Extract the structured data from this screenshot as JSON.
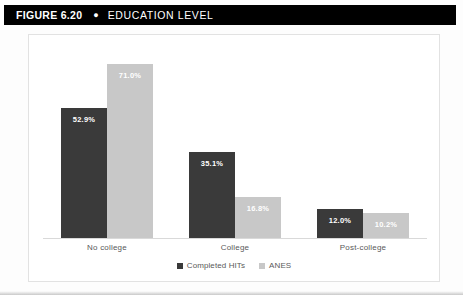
{
  "header": {
    "figure_label": "FIGURE 6.20",
    "bullet": "●",
    "title": "EDUCATION LEVEL"
  },
  "colors": {
    "header_background": "#000000",
    "header_text": "#ffffff",
    "series_completed_hits": "#3a3a3a",
    "series_anes": "#c8c8c8",
    "frame_border": "#e2e2e2",
    "axis_line": "#d9d9d9",
    "label_text": "#595959"
  },
  "chart_data": {
    "type": "bar",
    "title": "EDUCATION LEVEL",
    "xlabel": "",
    "ylabel": "",
    "ylim": [
      0,
      80
    ],
    "grid": false,
    "legend_position": "bottom",
    "categories": [
      "No college",
      "College",
      "Post-college"
    ],
    "series": [
      {
        "name": "Completed HITs",
        "color": "#3a3a3a",
        "values": [
          52.9,
          35.1,
          12.0
        ],
        "labels": [
          "52.9%",
          "35.1%",
          "12.0%"
        ]
      },
      {
        "name": "ANES",
        "color": "#c8c8c8",
        "values": [
          71.0,
          16.8,
          10.2
        ],
        "labels": [
          "71.0%",
          "16.8%",
          "10.2%"
        ]
      }
    ]
  }
}
